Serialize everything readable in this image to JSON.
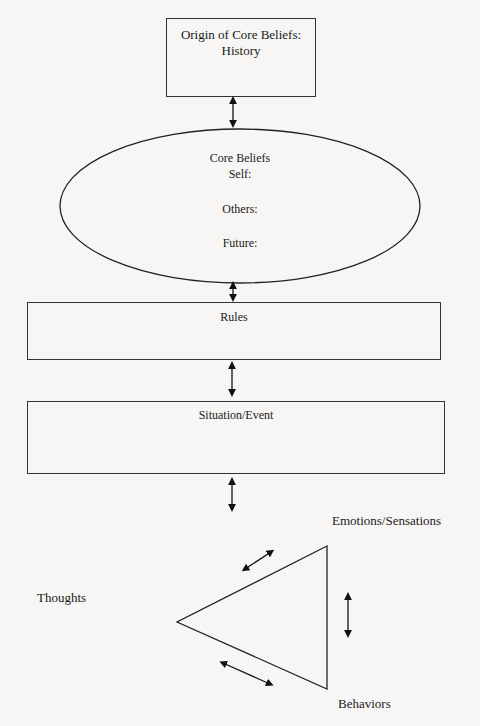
{
  "diagram": {
    "title_box": {
      "line1": "Origin of Core Beliefs:",
      "line2": "History"
    },
    "core_beliefs": {
      "title": "Core Beliefs",
      "self": "Self:",
      "others": "Others:",
      "future": "Future:"
    },
    "rules": {
      "label": "Rules"
    },
    "situation": {
      "label": "Situation/Event"
    },
    "triangle": {
      "top_right": "Emotions/Sensations",
      "left": "Thoughts",
      "bottom_right": "Behaviors"
    }
  }
}
